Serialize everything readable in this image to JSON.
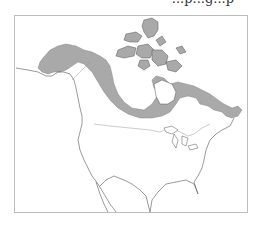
{
  "header": {
    "cropped_text": "...p...g...p"
  },
  "map": {
    "region": "North America",
    "range_fill": "#a9a9a9",
    "outline_color": "#555555",
    "border_color": "#bdbdbd",
    "frame_color": "#bdbdbd",
    "shaded_region": "Alaska, northern Canada and Canadian Arctic Archipelago"
  }
}
